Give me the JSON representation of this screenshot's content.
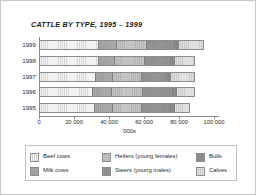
{
  "chart_data": {
    "type": "bar",
    "orientation": "horizontal",
    "stacked": true,
    "title": "CATTLE BY TYPE, 1995 – 1999",
    "xlabel": "'000s",
    "ylabel": "",
    "xlim": [
      0,
      102857
    ],
    "grid": false,
    "legend_position": "bottom",
    "xticks": [
      0,
      20000,
      40000,
      60000,
      80000,
      100000
    ],
    "xtick_labels": [
      "0",
      "20 000",
      "40 000",
      "60 000",
      "80 000",
      "100 000"
    ],
    "categories": [
      "1999",
      "1998",
      "1997",
      "1996",
      "1995"
    ],
    "series": [
      {
        "name": "Beef cows",
        "color": "#f2f2f2",
        "values": [
          34286,
          34286,
          32571,
          30857,
          32000
        ]
      },
      {
        "name": "Milk cows",
        "color": "#a8a8a8",
        "values": [
          10286,
          9143,
          9714,
          10857,
          10286
        ]
      },
      {
        "name": "Heifers (young females)",
        "color": "#c4c4c4",
        "values": [
          17143,
          17143,
          16571,
          17714,
          16571
        ]
      },
      {
        "name": "Steers (young males)",
        "color": "#949494",
        "values": [
          16571,
          15429,
          14857,
          17714,
          17143
        ]
      },
      {
        "name": "Bulls",
        "color": "#8c8c8c",
        "values": [
          2286,
          2286,
          2286,
          2286,
          2286
        ]
      },
      {
        "name": "Calves",
        "color": "#e0e0e0",
        "values": [
          13714,
          10857,
          13143,
          9714,
          8000
        ]
      }
    ],
    "totals": [
      94286,
      89144,
      89142,
      89142,
      86286
    ]
  },
  "legend": {
    "items": [
      {
        "label": "Beef cows"
      },
      {
        "label": "Heifers (young females)"
      },
      {
        "label": "Bulls"
      },
      {
        "label": "Milk cows"
      },
      {
        "label": "Steers (young males)"
      },
      {
        "label": "Calves"
      }
    ]
  }
}
